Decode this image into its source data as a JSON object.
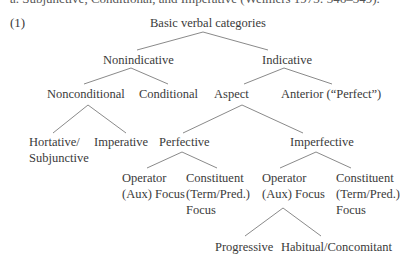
{
  "clipped_header": "a. Subjunctive, Conditional, and Imperative (Welmers 1973: 346–349).",
  "example_number": "(1)",
  "tree": {
    "root": {
      "label": "Basic verbal categories"
    },
    "level1": [
      {
        "label": "Nonindicative"
      },
      {
        "label": "Indicative"
      }
    ],
    "level2": [
      {
        "label": "Nonconditional"
      },
      {
        "label": "Conditional"
      },
      {
        "label": "Aspect"
      },
      {
        "label": "Anterior (“Perfect”)"
      }
    ],
    "level3": [
      {
        "lines": [
          "Hortative/",
          "Subjunctive"
        ]
      },
      {
        "label": "Imperative"
      },
      {
        "label": "Perfective"
      },
      {
        "label": "Imperfective"
      }
    ],
    "level4": [
      {
        "lines": [
          "Operator",
          "(Aux) Focus"
        ]
      },
      {
        "lines": [
          "Constituent",
          "(Term/Pred.)",
          "Focus"
        ]
      },
      {
        "lines": [
          "Operator",
          "(Aux) Focus"
        ]
      },
      {
        "lines": [
          "Constituent",
          "(Term/Pred.)",
          "Focus"
        ]
      }
    ],
    "level5": [
      {
        "label": "Progressive"
      },
      {
        "label": "Habitual/Concomitant"
      }
    ]
  },
  "style": {
    "line_color": "#8a8a8a",
    "text_color": "#3a3a3a"
  }
}
